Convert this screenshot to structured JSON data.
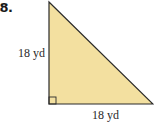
{
  "problem": {
    "number": "68."
  },
  "figure": {
    "shape": "right-triangle",
    "fill_color": "#f3e0a0",
    "stroke_color": "#2a2a2a",
    "right_angle_marker": true,
    "legs": {
      "vertical_label": "18 yd",
      "horizontal_label": "18 yd"
    }
  }
}
